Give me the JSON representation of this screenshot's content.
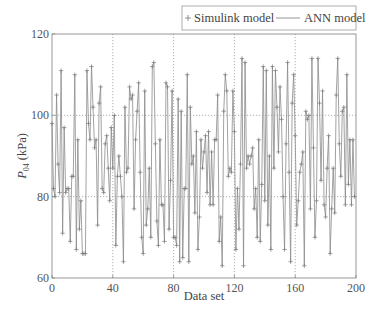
{
  "chart_data": {
    "type": "line",
    "title": "",
    "xlabel": "Data set",
    "ylabel": "P04 (kPa)",
    "ylabel_main": "P",
    "ylabel_sub": "04",
    "ylabel_unit": "(kPa)",
    "xlim": [
      0,
      200
    ],
    "ylim": [
      60,
      120
    ],
    "xticks": [
      0,
      40,
      80,
      120,
      160,
      200
    ],
    "yticks": [
      60,
      80,
      100,
      120
    ],
    "grid": {
      "x_dotted_at": [
        40,
        80,
        120,
        160
      ],
      "y_dotted_at": [
        80,
        100
      ]
    },
    "legend": {
      "position": "top-right, above plot",
      "entries": [
        {
          "label": "Simulink model",
          "style": "marker",
          "marker": "+"
        },
        {
          "label": "ANN model",
          "style": "line"
        }
      ]
    },
    "colors": {
      "line": "#8a8a8a",
      "marker": "#7a7a7a",
      "axis": "#888888",
      "grid": "#9a9a9a"
    },
    "series": [
      {
        "name": "Simulink model",
        "x_start": 0,
        "x_step": 1,
        "values": [
          98,
          82,
          80,
          105,
          88,
          81,
          111,
          71,
          97,
          81,
          82,
          82,
          69,
          85,
          85,
          110,
          67,
          94,
          72,
          79,
          66,
          66,
          66,
          111,
          98,
          94,
          112,
          102,
          92,
          94,
          73,
          103,
          107,
          82,
          81,
          93,
          95,
          87,
          79,
          97,
          87,
          100,
          68,
          85,
          90,
          85,
          80,
          64,
          102,
          86,
          87,
          107,
          104,
          105,
          77,
          94,
          101,
          108,
          86,
          70,
          66,
          106,
          73,
          77,
          87,
          70,
          112,
          113,
          93,
          74,
          68,
          94,
          78,
          78,
          69,
          108,
          107,
          72,
          84,
          106,
          70,
          70,
          68,
          104,
          64,
          101,
          65,
          82,
          82,
          110,
          64,
          102,
          88,
          90,
          76,
          96,
          67,
          75,
          94,
          87,
          91,
          95,
          81,
          96,
          78,
          91,
          78,
          94,
          94,
          105,
          69,
          75,
          63,
          101,
          110,
          106,
          85,
          87,
          86,
          106,
          96,
          67,
          82,
          72,
          88,
          114,
          63,
          113,
          87,
          90,
          88,
          90,
          92,
          77,
          82,
          70,
          94,
          69,
          83,
          112,
          79,
          111,
          73,
          90,
          67,
          112,
          87,
          111,
          102,
          91,
          107,
          99,
          80,
          67,
          93,
          113,
          86,
          64,
          103,
          110,
          95,
          73,
          79,
          86,
          88,
          91,
          63,
          101,
          99,
          100,
          77,
          114,
          92,
          70,
          79,
          114,
          103,
          84,
          106,
          78,
          75,
          87,
          95,
          66,
          77,
          87,
          76,
          105,
          114,
          93,
          85,
          101,
          102,
          78,
          110,
          83,
          94,
          78,
          94,
          80
        ]
      },
      {
        "name": "ANN model",
        "x_start": 0,
        "x_step": 1,
        "same_as": "Simulink model"
      }
    ]
  }
}
